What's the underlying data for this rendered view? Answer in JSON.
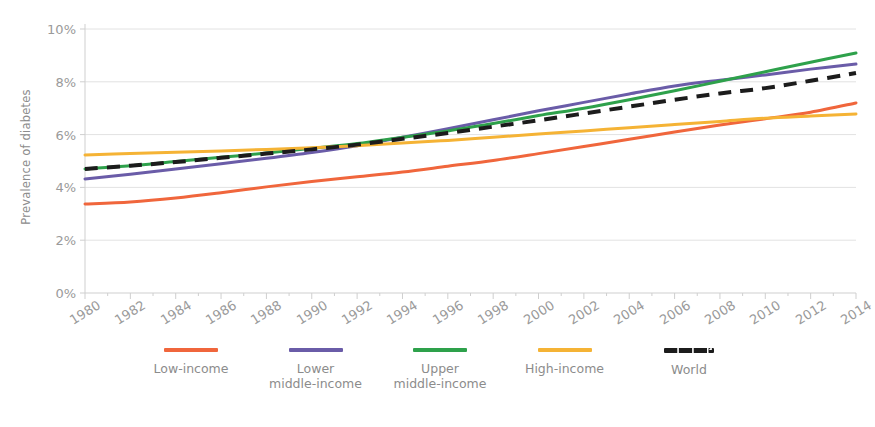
{
  "chart_data": {
    "type": "line",
    "title": "",
    "xlabel": "",
    "ylabel": "Prevalence of diabetes",
    "xlim": [
      1980,
      2014
    ],
    "ylim": [
      0,
      10
    ],
    "grid": true,
    "legend_position": "bottom",
    "ytick_labels": [
      "10%",
      "8%",
      "6%",
      "4%",
      "2%",
      "0%"
    ],
    "ytick_values": [
      10,
      8,
      6,
      4,
      2,
      0
    ],
    "xtick_labels": [
      "1980",
      "1982",
      "1984",
      "1986",
      "1988",
      "1990",
      "1992",
      "1994",
      "1996",
      "1998",
      "2000",
      "2002",
      "2004",
      "2006",
      "2008",
      "2010",
      "2012",
      "2014"
    ],
    "x": [
      1980,
      1982,
      1984,
      1986,
      1988,
      1990,
      1992,
      1994,
      1996,
      1998,
      2000,
      2002,
      2004,
      2006,
      2008,
      2010,
      2012,
      2014
    ],
    "series": [
      {
        "name": "Low-income",
        "label": "Low-income",
        "color": "#F0663C",
        "style": "solid",
        "values": [
          3.37,
          3.45,
          3.6,
          3.8,
          4.02,
          4.22,
          4.4,
          4.58,
          4.8,
          5.02,
          5.28,
          5.55,
          5.82,
          6.1,
          6.36,
          6.6,
          6.85,
          7.2
        ]
      },
      {
        "name": "Lower middle-income",
        "label": "Lower\nmiddle-income",
        "color": "#6A5CA8",
        "style": "solid",
        "values": [
          4.32,
          4.5,
          4.7,
          4.9,
          5.1,
          5.32,
          5.58,
          5.9,
          6.22,
          6.56,
          6.9,
          7.22,
          7.54,
          7.84,
          8.06,
          8.26,
          8.48,
          8.67
        ]
      },
      {
        "name": "Upper middle-income",
        "label": "Upper\nmiddle-income",
        "color": "#2EA14B",
        "style": "solid",
        "values": [
          4.7,
          4.82,
          4.98,
          5.14,
          5.3,
          5.48,
          5.66,
          5.9,
          6.14,
          6.42,
          6.72,
          7.0,
          7.32,
          7.66,
          8.02,
          8.38,
          8.74,
          9.09
        ]
      },
      {
        "name": "High-income",
        "label": "High-income",
        "color": "#F5B335",
        "style": "solid",
        "values": [
          5.23,
          5.28,
          5.33,
          5.38,
          5.44,
          5.5,
          5.58,
          5.68,
          5.78,
          5.9,
          6.02,
          6.14,
          6.26,
          6.38,
          6.5,
          6.62,
          6.7,
          6.78
        ]
      },
      {
        "name": "World",
        "label": "World",
        "color": "#1c1c1c",
        "style": "dashed",
        "values": [
          4.7,
          4.82,
          4.96,
          5.12,
          5.28,
          5.44,
          5.62,
          5.84,
          6.06,
          6.3,
          6.54,
          6.8,
          7.06,
          7.32,
          7.56,
          7.76,
          8.04,
          8.33
        ]
      }
    ]
  }
}
